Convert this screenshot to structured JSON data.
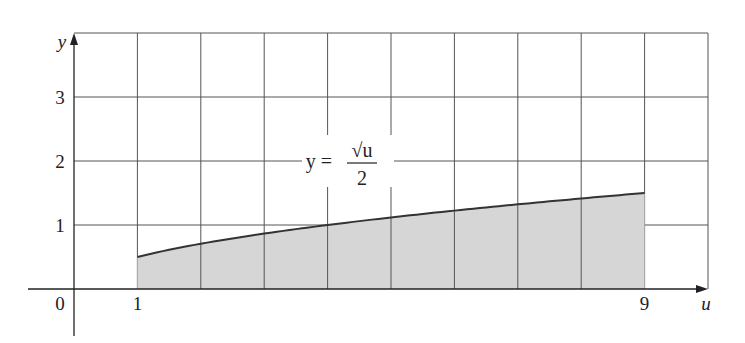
{
  "chart_data": {
    "type": "area",
    "title": "",
    "xlabel": "u",
    "ylabel": "y",
    "function": "y = sqrt(u)/2",
    "annotation": {
      "lhs": "y =",
      "numerator": "√u",
      "denominator": "2",
      "position_u": 4.6,
      "position_y": 2.0
    },
    "shaded_region": {
      "from": 1,
      "to": 9
    },
    "xlim": [
      0,
      10
    ],
    "ylim": [
      0,
      4
    ],
    "x_ticks": [
      {
        "value": 0,
        "label": "0"
      },
      {
        "value": 1,
        "label": "1"
      },
      {
        "value": 9,
        "label": "9"
      }
    ],
    "y_ticks": [
      {
        "value": 1,
        "label": "1"
      },
      {
        "value": 2,
        "label": "2"
      },
      {
        "value": 3,
        "label": "3"
      }
    ],
    "grid": true,
    "grid_step_x": 1,
    "grid_step_y": 1,
    "x": [
      1,
      2,
      3,
      4,
      5,
      6,
      7,
      8,
      9
    ],
    "series": [
      {
        "name": "y = √u / 2",
        "values": [
          0.5,
          0.707,
          0.866,
          1.0,
          1.118,
          1.225,
          1.323,
          1.414,
          1.5
        ]
      }
    ]
  },
  "colors": {
    "grid": "#555555",
    "axis": "#222222",
    "curve": "#333333",
    "fill": "#d6d6d6"
  }
}
